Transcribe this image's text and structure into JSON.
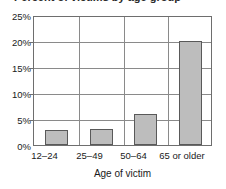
{
  "chart_data": {
    "type": "bar",
    "title": "",
    "title_cropped_fragment": "Percent of victims by age group",
    "categories": [
      "12–24",
      "25–49",
      "50–64",
      "65 or older"
    ],
    "values": [
      2.9,
      3.2,
      6.1,
      20.3
    ],
    "value_labels": [
      "",
      "",
      "",
      ""
    ],
    "xlabel": "Age of victim",
    "ylabel": "",
    "ylim": [
      0,
      25
    ],
    "yticks": [
      0,
      5,
      10,
      15,
      20,
      25
    ],
    "ytick_labels": [
      "0%",
      "5%",
      "10%",
      "15%",
      "20%",
      "25%"
    ],
    "grid": true,
    "grid_axis": "y",
    "legend": false,
    "legend_position": "none",
    "series": [
      {
        "name": "Percent of victims",
        "values": [
          2.9,
          3.2,
          6.1,
          20.3
        ]
      }
    ],
    "colors": {
      "bar_fill": "#bdbdbd",
      "bar_border": "#595959",
      "gridline": "#8a8a8a",
      "axis": "#6e6e6e",
      "text": "#1a1a1a",
      "background": "#ffffff"
    }
  }
}
